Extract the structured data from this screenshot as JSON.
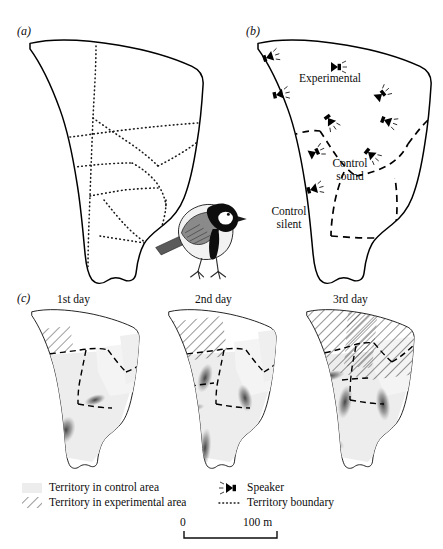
{
  "figure": {
    "background_color": "#ffffff",
    "ink_color": "#000000",
    "control_fill_color": "#ededed",
    "hatch_color": "#2b2b2b"
  },
  "panels": [
    {
      "letter": "(a)",
      "name": "study-plot-territories",
      "description": "Study plot outline with dotted territory boundaries"
    },
    {
      "letter": "(b)",
      "name": "treatment-areas",
      "description": "Study plot divided into treatment areas with speakers"
    },
    {
      "letter": "(c)",
      "name": "settlement-by-day",
      "description": "Territory settlement across three days"
    }
  ],
  "panel_b": {
    "area_labels": [
      {
        "name": "experimental",
        "text": "Experimental"
      },
      {
        "name": "control-sound",
        "text": "Control\nsound"
      },
      {
        "name": "control-silent",
        "text": "Control\nsilent"
      }
    ],
    "speaker_count": 9
  },
  "panel_c": {
    "day_labels": [
      "1st day",
      "2nd day",
      "3rd day"
    ]
  },
  "legend": {
    "items": [
      {
        "name": "territory-control-area",
        "swatch": "gray-fill",
        "label": "Territory in control area"
      },
      {
        "name": "territory-experimental-area",
        "swatch": "hatch-fill",
        "label": "Territory in experimental area"
      },
      {
        "name": "speaker",
        "swatch": "speaker-icon",
        "label": "Speaker"
      },
      {
        "name": "territory-boundary",
        "swatch": "dotted-line",
        "label": "Territory boundary"
      }
    ]
  },
  "scale_bar": {
    "start_label": "0",
    "end_label": "100 m"
  },
  "illustration": {
    "name": "great-tit-bird",
    "label": "great tit"
  }
}
